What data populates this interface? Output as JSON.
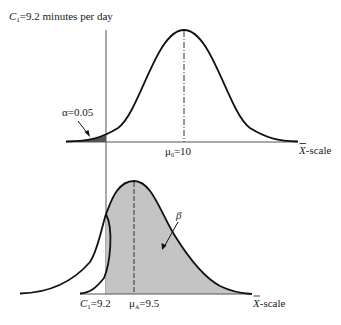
{
  "figure": {
    "title_label": "C",
    "title_sub": "1",
    "title_rest": "=9.2 minutes per day",
    "colors": {
      "curve": "#111111",
      "axis": "#555555",
      "alpha_fill": "#555555",
      "beta_fill": "#c4c4c4"
    },
    "top_panel": {
      "alpha_label": "α=0.05",
      "mean_label_sym": "μ",
      "mean_label_sub": "0",
      "mean_label_rest": "=10",
      "axis_label_sym": "X",
      "axis_label_rest": "-scale"
    },
    "bottom_panel": {
      "beta_label": "β",
      "critical_label_sym": "C",
      "critical_label_sub": "1",
      "critical_label_rest": "=9.2",
      "mean_label_sym": "μ",
      "mean_label_sub": "A",
      "mean_label_rest": "=9.5",
      "axis_label_sym": "X",
      "axis_label_rest": "-scale"
    }
  }
}
